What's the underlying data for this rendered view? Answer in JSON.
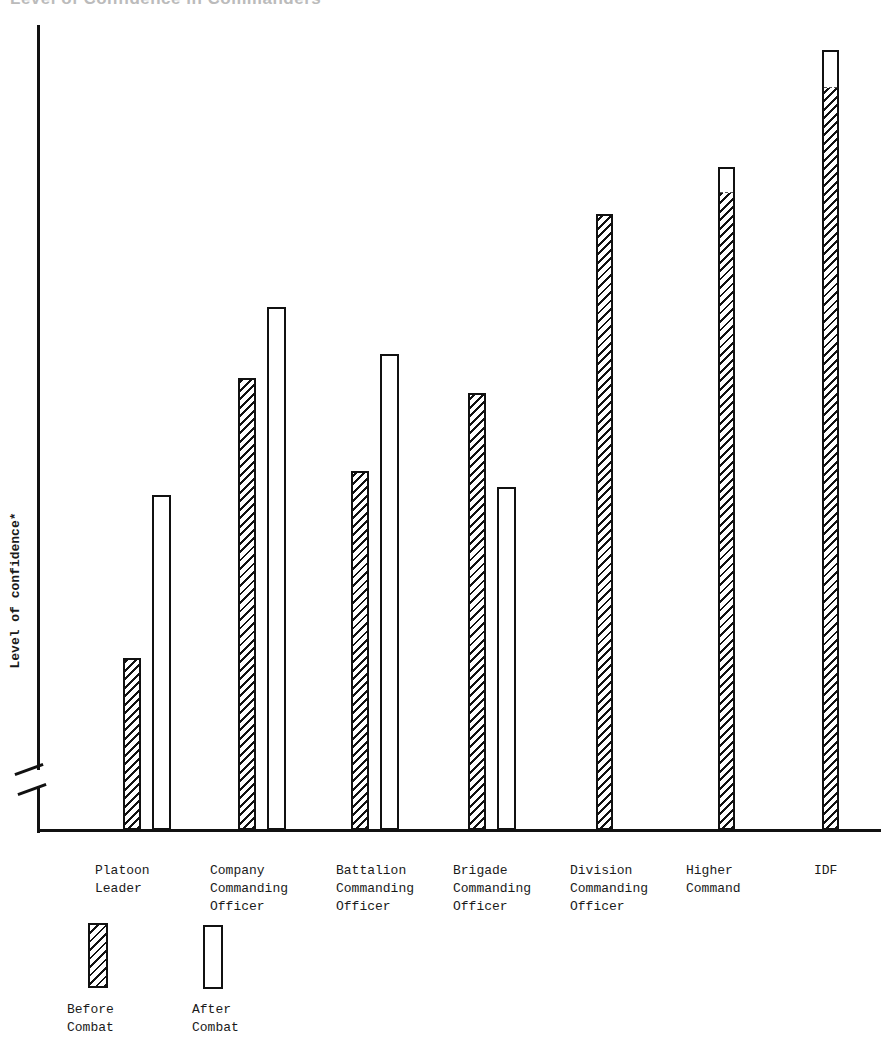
{
  "chart_data": {
    "type": "bar",
    "title": "Level of Confidence in Commanders",
    "xlabel": "",
    "ylabel": "Level of confidence*",
    "y_axis_broken": true,
    "y_ticks": [],
    "grid": false,
    "legend_position": "bottom-left",
    "categories": [
      "Platoon Leader",
      "Company Commanding Officer",
      "Battalion Commanding Officer",
      "Brigade Commanding Officer",
      "Division Commanding Officer",
      "Higher Command",
      "IDF"
    ],
    "series": [
      {
        "name": "Before Combat",
        "pattern": "hatched",
        "values": [
          22,
          58,
          46,
          56,
          79,
          85,
          100
        ]
      },
      {
        "name": "After Combat",
        "pattern": "open",
        "values": [
          43,
          67,
          61,
          44,
          null,
          null,
          null
        ]
      }
    ],
    "value_scale_note": "relative bar height, tallest bar = 100 (no numeric ticks shown)"
  },
  "title": "Level of Confidence in Commanders",
  "y_label": "Level of confidence*",
  "categories": [
    {
      "label": "Platoon\nLeader"
    },
    {
      "label": "Company\nCommanding\nOfficer"
    },
    {
      "label": "Battalion\nCommanding\nOfficer"
    },
    {
      "label": "Brigade\nCommanding\nOfficer"
    },
    {
      "label": "Division\nCommanding\nOfficer"
    },
    {
      "label": "Higher\nCommand"
    },
    {
      "label": "IDF"
    }
  ],
  "legend": {
    "before": "Before\nCombat",
    "after": "After\nCombat"
  }
}
